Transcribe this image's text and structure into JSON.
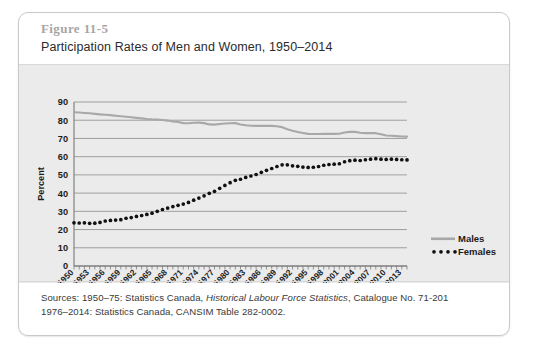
{
  "figure": {
    "number": "Figure 11-5",
    "title": "Participation Rates of Men and Women, 1950–2014"
  },
  "sources": {
    "line1_prefix": "Sources: 1950–75: Statistics Canada, ",
    "line1_italic": "Historical Labour Force Statistics",
    "line1_suffix": ", Catalogue No. 71-201",
    "line2": "1976–2014: Statistics Canada, CANSIM Table 282-0002."
  },
  "colors": {
    "panel_background": "#ebebeb",
    "plot_background": "#ebebeb",
    "gridline": "#8c8c8c",
    "males_line": "#a8a8a8",
    "females_dots": "#111111",
    "card_border": "#c9c9c9",
    "figure_number_text": "#a6a6a6",
    "title_text": "#2b2b2b"
  },
  "chart_data": {
    "type": "line",
    "title": "Participation Rates of Men and Women, 1950–2014",
    "xlabel": "",
    "ylabel": "Percent",
    "ylim": [
      0,
      90
    ],
    "ytick_step": 10,
    "yticks": [
      0,
      10,
      20,
      30,
      40,
      50,
      60,
      70,
      80,
      90
    ],
    "grid": true,
    "grid_axis": "y",
    "legend_position": "right",
    "xlim": [
      1950,
      2014
    ],
    "xtick_labels": [
      "1950",
      "1953",
      "1956",
      "1959",
      "1962",
      "1965",
      "1968",
      "1971",
      "1974",
      "1977",
      "1980",
      "1983",
      "1986",
      "1989",
      "1992",
      "1995",
      "1998",
      "2001",
      "2004",
      "2007",
      "2010",
      "2013"
    ],
    "xtick_label_step": 3,
    "minor_tick_step": 1,
    "x": [
      1950,
      1951,
      1952,
      1953,
      1954,
      1955,
      1956,
      1957,
      1958,
      1959,
      1960,
      1961,
      1962,
      1963,
      1964,
      1965,
      1966,
      1967,
      1968,
      1969,
      1970,
      1971,
      1972,
      1973,
      1974,
      1975,
      1976,
      1977,
      1978,
      1979,
      1980,
      1981,
      1982,
      1983,
      1984,
      1985,
      1986,
      1987,
      1988,
      1989,
      1990,
      1991,
      1992,
      1993,
      1994,
      1995,
      1996,
      1997,
      1998,
      1999,
      2000,
      2001,
      2002,
      2003,
      2004,
      2005,
      2006,
      2007,
      2008,
      2009,
      2010,
      2011,
      2012,
      2013,
      2014
    ],
    "series": [
      {
        "name": "Males",
        "style": "solid-line",
        "color": "#a8a8a8",
        "values": [
          84.4,
          84.2,
          84.0,
          83.8,
          83.5,
          83.2,
          83.0,
          82.8,
          82.5,
          82.2,
          81.9,
          81.6,
          81.3,
          81.0,
          80.7,
          80.5,
          80.4,
          80.1,
          79.8,
          79.3,
          79.0,
          78.4,
          78.3,
          78.6,
          78.7,
          78.4,
          77.7,
          77.6,
          77.9,
          78.2,
          78.3,
          78.4,
          77.7,
          77.2,
          77.0,
          76.9,
          76.9,
          76.9,
          76.9,
          76.7,
          76.2,
          75.1,
          74.2,
          73.5,
          73.0,
          72.5,
          72.4,
          72.4,
          72.5,
          72.5,
          72.5,
          72.6,
          73.3,
          73.6,
          73.6,
          73.1,
          72.9,
          73.0,
          72.9,
          72.3,
          71.6,
          71.5,
          71.3,
          71.1,
          71.0
        ]
      },
      {
        "name": "Females",
        "style": "dotted",
        "color": "#111111",
        "values": [
          23.7,
          23.6,
          23.7,
          23.4,
          23.5,
          23.9,
          24.7,
          25.0,
          25.2,
          25.4,
          26.2,
          26.6,
          27.2,
          27.7,
          28.3,
          29.0,
          30.0,
          31.0,
          31.8,
          32.6,
          33.3,
          34.0,
          34.9,
          36.1,
          37.3,
          38.5,
          39.9,
          41.0,
          42.6,
          44.2,
          45.7,
          47.0,
          47.6,
          48.6,
          49.4,
          50.2,
          51.4,
          52.5,
          53.5,
          54.6,
          55.5,
          55.5,
          55.0,
          54.7,
          54.3,
          54.1,
          54.2,
          54.6,
          55.3,
          55.7,
          55.9,
          56.1,
          57.2,
          57.8,
          58.1,
          57.9,
          58.3,
          58.6,
          58.9,
          58.6,
          58.5,
          58.6,
          58.5,
          58.3,
          58.2
        ]
      }
    ]
  },
  "legend": {
    "items": [
      {
        "label": "Males",
        "marker": "solid-line-swatch"
      },
      {
        "label": "Females",
        "marker": "dotted-swatch"
      }
    ]
  }
}
